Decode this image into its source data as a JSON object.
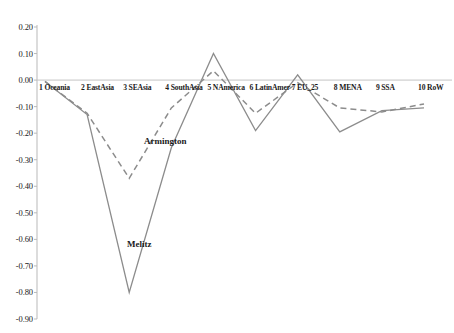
{
  "chart_data": {
    "type": "line",
    "title": "",
    "subtitle": "",
    "xlabel": "",
    "ylabel": "",
    "grid": false,
    "legend_position": "inline-annotation",
    "ylim": [
      -0.9,
      0.2
    ],
    "yticks": [
      "0.20",
      "0.10",
      "0.00",
      "-0.10",
      "-0.20",
      "-0.30",
      "-0.40",
      "-0.50",
      "-0.60",
      "-0.70",
      "-0.80",
      "-0.90"
    ],
    "ytick_values": [
      0.2,
      0.1,
      0.0,
      -0.1,
      -0.2,
      -0.3,
      -0.4,
      -0.5,
      -0.6,
      -0.7,
      -0.8,
      -0.9
    ],
    "categories": [
      "1 Oceania",
      "2 EastAsia",
      "3 SEAsia",
      "4 SouthAsia",
      "5 NAmerica",
      "6 LatinAmer",
      "7 EU_25",
      "8 MENA",
      "9 SSA",
      "10 RoW"
    ],
    "series": [
      {
        "name": "Armington",
        "style": "dashed",
        "color": "#8c8c8c",
        "values": [
          -0.005,
          -0.125,
          -0.37,
          -0.105,
          0.035,
          -0.125,
          -0.01,
          -0.105,
          -0.12,
          -0.09
        ]
      },
      {
        "name": "Melitz",
        "style": "solid",
        "color": "#8c8c8c",
        "values": [
          -0.005,
          -0.13,
          -0.8,
          -0.255,
          0.1,
          -0.19,
          0.02,
          -0.195,
          -0.115,
          -0.105
        ]
      }
    ],
    "annotations": [
      {
        "text": "Armington",
        "x_value": 3.35,
        "y_value": -0.235
      },
      {
        "text": "Melitz",
        "x_value": 2.95,
        "y_value": -0.62
      }
    ]
  }
}
